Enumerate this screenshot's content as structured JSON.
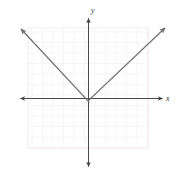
{
  "figure": {
    "width": 177,
    "height": 174,
    "background_color": "#ffffff"
  },
  "grid": {
    "visible": true,
    "color": "#f2ecec",
    "cell_size": 10.5,
    "left": 28,
    "top": 28,
    "right": 148,
    "bottom": 148,
    "columns": 12,
    "rows": 12
  },
  "axes": {
    "color": "#4a4a4a",
    "stroke_width": 1,
    "origin": {
      "x": 88,
      "y": 98
    },
    "x_axis": {
      "label": "x",
      "label_x": 166,
      "label_y": 95,
      "start_x": 20,
      "end_x": 162,
      "y": 98,
      "arrow_start": true,
      "arrow_end": true
    },
    "y_axis": {
      "label": "y",
      "label_x": 91,
      "label_y": 7,
      "start_y": 18,
      "end_y": 166,
      "x": 88,
      "arrow_start": true,
      "arrow_end": true
    }
  },
  "chart_data": {
    "type": "line",
    "title": "",
    "xlabel": "x",
    "ylabel": "y",
    "grid": true,
    "legend": null,
    "xlim": [
      -6,
      6
    ],
    "ylim": [
      -6,
      6
    ],
    "curve_color": "#6e6e6e",
    "curve_stroke_width": 1.2,
    "function": "y = |x|",
    "vertex": {
      "x": 0,
      "y": -0.3
    },
    "slopes": {
      "left": -1.07,
      "right": 1.07
    },
    "series": [
      {
        "name": "y = |x|",
        "points": [
          {
            "x": -6.4,
            "y": 6.6
          },
          {
            "x": 0,
            "y": -0.3
          },
          {
            "x": 7.3,
            "y": 6.7
          }
        ],
        "pixel_points": [
          {
            "px": 21,
            "py": 29
          },
          {
            "px": 88,
            "py": 101
          },
          {
            "px": 165,
            "py": 28
          }
        ],
        "arrow_start": true,
        "arrow_end": true
      }
    ]
  }
}
